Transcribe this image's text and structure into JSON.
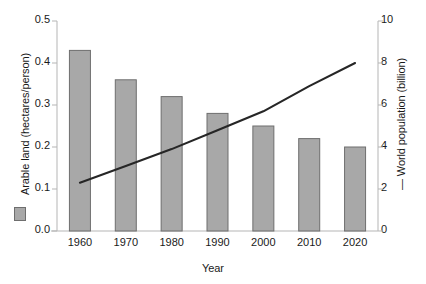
{
  "chart_data": {
    "type": "bar",
    "title": "",
    "xlabel": "Year",
    "categories": [
      "1960",
      "1970",
      "1980",
      "1990",
      "2000",
      "2010",
      "2020"
    ],
    "x": [
      1960,
      1970,
      1980,
      1990,
      2000,
      2010,
      2020
    ],
    "grid": false,
    "legend_position": "axis-labels",
    "series": [
      {
        "name": "Arable land (hectares/person)",
        "type": "bar",
        "axis": "left",
        "color": "#a8a8a8",
        "edge_color": "#6e6e6e",
        "values": [
          0.43,
          0.36,
          0.32,
          0.28,
          0.25,
          0.22,
          0.2
        ]
      },
      {
        "name": "World population (billion)",
        "type": "line",
        "axis": "right",
        "color": "#262626",
        "values": [
          2.3,
          3.1,
          3.9,
          4.8,
          5.7,
          6.9,
          8.0
        ]
      }
    ],
    "left_axis": {
      "label": "Arable land (hectares/person)",
      "ylim": [
        0.0,
        0.5
      ],
      "ticks": [
        "0.0",
        "0.1",
        "0.2",
        "0.3",
        "0.4",
        "0.5"
      ],
      "tick_values": [
        0.0,
        0.1,
        0.2,
        0.3,
        0.4,
        0.5
      ]
    },
    "right_axis": {
      "label": "World population (billion)",
      "ylim": [
        0,
        10
      ],
      "ticks": [
        "0",
        "2",
        "4",
        "6",
        "8",
        "10"
      ],
      "tick_values": [
        0,
        2,
        4,
        6,
        8,
        10
      ]
    }
  },
  "legend": {
    "bar_marker": "filled-gray-square",
    "line_marker": "—",
    "bar_label": "Arable land (hectares/person)",
    "line_label": "World population (billion)"
  },
  "labels": {
    "y_left_title": "Arable land (hectares/person)",
    "y_right_title": "— World population (billion)",
    "x_title": "Year"
  },
  "colors": {
    "bar_fill": "#a8a8a8",
    "bar_edge": "#6e6e6e",
    "line": "#262626",
    "axis": "#b5b5b5",
    "text": "#1a1a1a",
    "background": "#ffffff"
  }
}
